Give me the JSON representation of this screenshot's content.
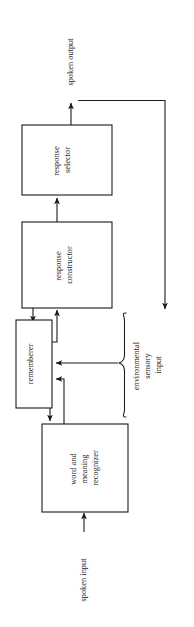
{
  "figure": {
    "orientation": "rotated-90-ccw",
    "background_color": "#ffffff",
    "line_color": "#1a1a1a"
  },
  "blocks": [
    {
      "id": "response-selector",
      "line1": "response",
      "line2": "selector",
      "line3": ""
    },
    {
      "id": "response-constructor",
      "line1": "response",
      "line2": "constructor",
      "line3": ""
    },
    {
      "id": "rememberer",
      "line1": "rememberer",
      "line2": "",
      "line3": ""
    },
    {
      "id": "word-and-meaning-recognizer",
      "line1": "word and",
      "line2": "meaning",
      "line3": "recognizer"
    }
  ],
  "labels": {
    "spoken_output": "spoken output",
    "spoken_input": "spoken input",
    "environmental_sensory_input_line1": "environmental",
    "environmental_sensory_input_line2": "sensory",
    "environmental_sensory_input_line3": "input"
  }
}
